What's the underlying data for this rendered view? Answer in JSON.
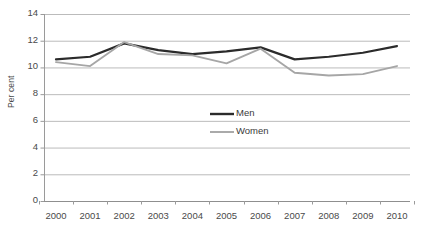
{
  "chart_data": {
    "type": "line",
    "title": "",
    "xlabel": "",
    "ylabel": "Per cent",
    "categories": [
      "2000",
      "2001",
      "2002",
      "2003",
      "2004",
      "2005",
      "2006",
      "2007",
      "2008",
      "2009",
      "2010"
    ],
    "x": [
      2000,
      2001,
      2002,
      2003,
      2004,
      2005,
      2006,
      2007,
      2008,
      2009,
      2010
    ],
    "series": [
      {
        "name": "Men",
        "color": "#2b2b2b",
        "values": [
          10.6,
          10.8,
          11.8,
          11.3,
          11.0,
          11.2,
          11.5,
          10.6,
          10.8,
          11.1,
          11.6
        ]
      },
      {
        "name": "Women",
        "color": "#a6a6a6",
        "values": [
          10.4,
          10.1,
          11.9,
          11.0,
          10.9,
          10.3,
          11.4,
          9.6,
          9.4,
          9.5,
          10.1
        ]
      }
    ],
    "ylim": [
      0,
      14
    ],
    "yticks": [
      0,
      2,
      4,
      6,
      8,
      10,
      12,
      14
    ],
    "ytick_labels": [
      "0",
      "2",
      "4",
      "6",
      "8",
      "10",
      "12",
      "14"
    ],
    "grid": true,
    "grid_color": "#b3b3b3",
    "legend": {
      "position": "inside-center",
      "entries": [
        {
          "label": "Men",
          "color": "#2b2b2b"
        },
        {
          "label": "Women",
          "color": "#a6a6a6"
        }
      ]
    },
    "plot_bg": "#ffffff"
  }
}
